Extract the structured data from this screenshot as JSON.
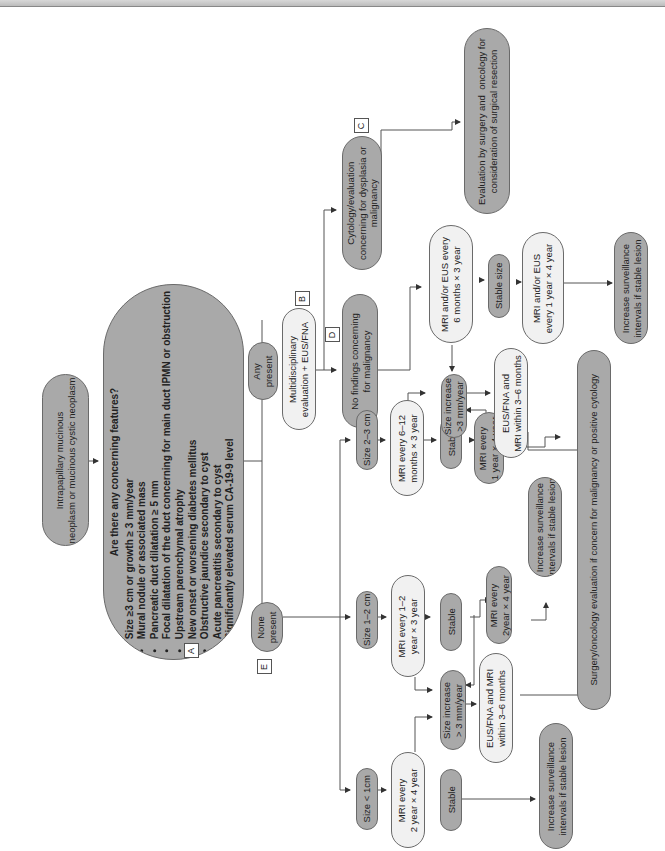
{
  "orientation": "rotated 90deg counter-clockwise",
  "labels": {
    "A": "A",
    "B": "B",
    "C": "C",
    "D": "D",
    "E": "E"
  },
  "nodes": {
    "start": "Intrapapillary mucinous\nneoplasm or mucinous cystic neoplasm",
    "concerning": {
      "question": "Are there any concerning features?",
      "items": [
        "Size ≥3 cm or growth ≥ 3 mm/year",
        "Mural nodule or associated mass",
        "Pancreatic duct dilatation ≥ 5 mm",
        "Focal dilatation of the duct concerning for main duct IPMN or obstruction",
        "Upstream parenchymal atrophy",
        "New onset or worsening diabetes mellitus",
        "Obstructive jaundice secondary to cyst",
        "Acute pancreatitis secondary to cyst",
        "Significantly elevated serum CA-19-9 level"
      ]
    },
    "any_present": "Any\npresent",
    "none_present": "None\npresent",
    "multidisciplinary": "Multidisciplinary\nevaluation + EUS/FNA",
    "cytology": "Cytology/evaluation\nconcerning for dysplasia or\nmalignancy",
    "eval_surgery": "Evaluation by surgery and  oncology for\nconsideration of surgical resection",
    "no_findings": "No findings concerning\nfor malignancy",
    "mri_eus_6m": "MRI and/or EUS every\n6 months × 3 year",
    "stable_size": "Stable size",
    "mri_eus_1y": "MRI and/or EUS\nevery 1 year × 4 year",
    "increase_surv_top": "Increase surveillance\nintervals if stable lesion",
    "size_2_3": "Size 2–3 cm",
    "mri_6_12": "MRI every 6–12\nmonths × 3 year",
    "stable_2_3": "Stable",
    "mri_1y_4y": "MRI every\n1 year × 4 year",
    "size_inc_top": "Size increase\n>3 mm/year",
    "eus_fna_top": "EUS/FNA and\nMRI within 3–6 months",
    "increase_surv_mid": "Increase surveillance\nintervals if stable lesion",
    "size_1_2": "Size 1–2 cm",
    "mri_1_2": "MRI every 1–2\nyear × 3 year",
    "stable_1_2": "Stable",
    "mri_2y_4y": "MRI every\n2year × 4 year",
    "size_inc_bottom": "Size increase\n> 3 mm/year",
    "eus_fna_bottom": "EUS/FNA and MRI\nwithin 3–6 months",
    "size_lt1": "Size < 1cm",
    "mri_2y_4y_lt1": "MRI every\n2 year × 4 year",
    "stable_lt1": "Stable",
    "increase_surv_bottom": "Increase surveillance\nintervals if stable lesion",
    "surgery_oncology": "Surgery/oncology evaluation if concern for malignancy or positive cytology"
  },
  "colors": {
    "dark_fill": "#a9a9a9",
    "light_fill": "#f1f1f1",
    "stroke": "#6a6a6a",
    "line": "#555555"
  }
}
